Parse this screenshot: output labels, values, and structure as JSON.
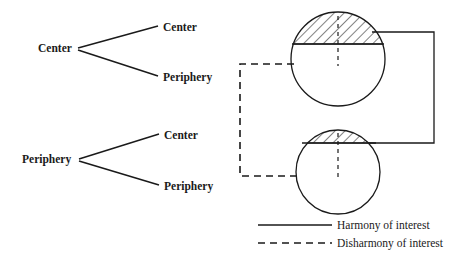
{
  "diagram": {
    "tree": {
      "groups": [
        {
          "root_label": "Center",
          "children": [
            {
              "label": "Center"
            },
            {
              "label": "Periphery"
            }
          ]
        },
        {
          "root_label": "Periphery",
          "children": [
            {
              "label": "Center"
            },
            {
              "label": "Periphery"
            }
          ]
        }
      ]
    },
    "circles": [
      {
        "name": "upper-circle",
        "hatched_cap_fraction": 0.36
      },
      {
        "name": "lower-circle",
        "hatched_cap_fraction": 0.14
      }
    ],
    "connectors": {
      "harmony": {
        "style": "solid",
        "side": "right"
      },
      "disharmony": {
        "style": "dashed",
        "side": "left"
      }
    },
    "legend": {
      "items": [
        {
          "style": "solid",
          "label": "Harmony of interest"
        },
        {
          "style": "dashed",
          "label": "Disharmony of interest"
        }
      ]
    },
    "colors": {
      "ink": "#1a1a1a",
      "background": "#ffffff"
    }
  }
}
